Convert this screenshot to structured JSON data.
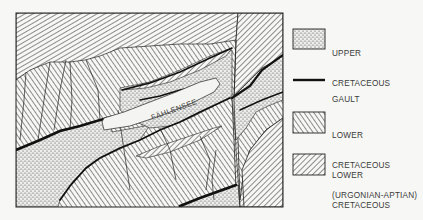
{
  "map": {
    "lake_label": "FÄHLENSEE"
  },
  "legend": {
    "items": [
      {
        "id": "upper-cretaceous",
        "pattern": "stipple",
        "line1": "UPPER",
        "line2": "CRETACEOUS",
        "line3": ""
      },
      {
        "id": "gault",
        "pattern": "thick-line",
        "line1": "GAULT",
        "line2": "",
        "line3": ""
      },
      {
        "id": "lower-cretaceous-urgonian-aptian",
        "pattern": "hatch-backslash",
        "line1": "LOWER",
        "line2": "CRETACEOUS",
        "line3": "(URGONIAN-APTIAN)"
      },
      {
        "id": "lower-cretaceous-hauterivian",
        "pattern": "hatch-forwardslash",
        "line1": "LOWER",
        "line2": "CRETACEOUS",
        "line3": "(HAUTERIVIAN)"
      }
    ]
  },
  "colors": {
    "background": "#f7f7f5",
    "ink": "#222222",
    "lake": "#f4f4f2"
  }
}
